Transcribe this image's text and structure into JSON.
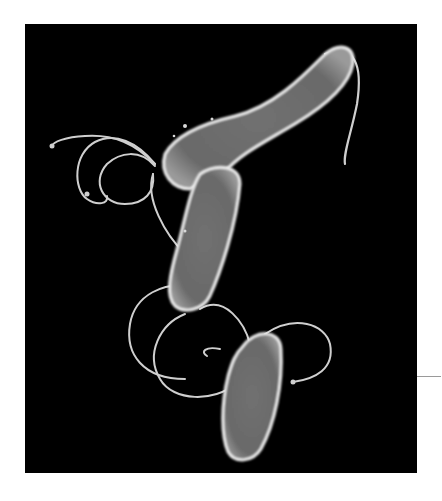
{
  "image": {
    "subject": "scanning electron micrograph of helical rod-shaped bacteria with flagella",
    "background_color": "#000000",
    "page_color": "#ffffff",
    "cell_fill": "#6e6e6e",
    "cell_edge": "#e8e8e8",
    "flagella_color": "#d0d0d0",
    "cells": [
      {
        "id": "cell-upper",
        "description": "long rod from upper right, tip near top right with single flagellum"
      },
      {
        "id": "cell-middle",
        "description": "rod running down-left from upper cell junction"
      },
      {
        "id": "cell-lower",
        "description": "short oval rod at bottom center"
      }
    ],
    "annotation_line_color": "#9a9a9a"
  }
}
